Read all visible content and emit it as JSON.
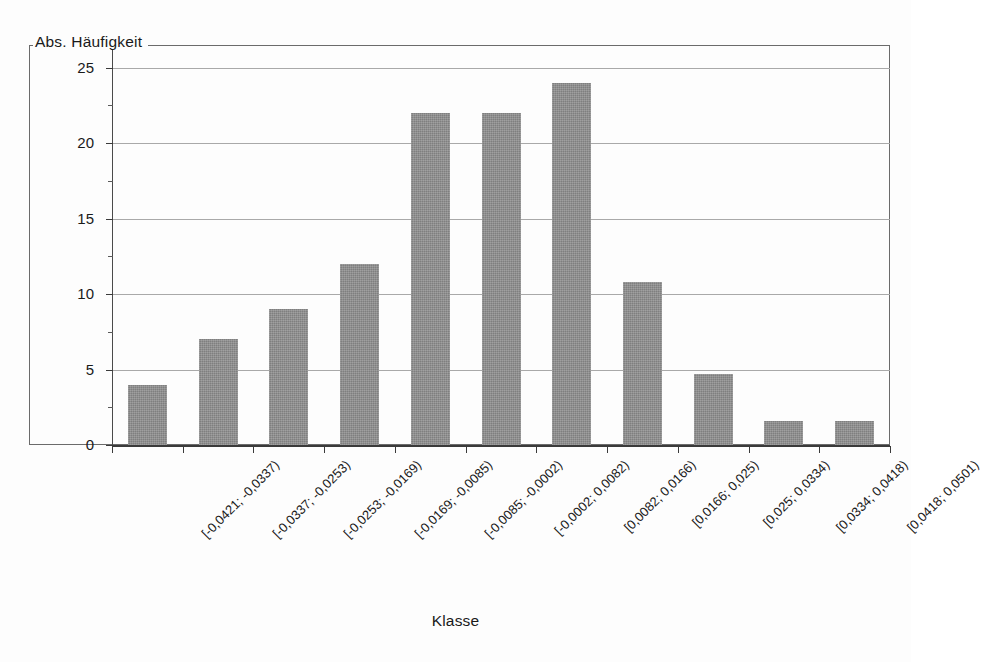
{
  "chart_data": {
    "type": "bar",
    "title": "",
    "subtitle": "",
    "xlabel": "Klasse",
    "ylabel": "Abs. Häufigkeit",
    "categories": [
      "[-0,0421; -0,0337)",
      "[-0,0337; -0,0253)",
      "[-0,0253; -0,0169)",
      "[-0,0169; -0,0085)",
      "[-0,0085; -0,0002)",
      "[-0,0002; 0,0082)",
      "[0,0082; 0,0166)",
      "[0,0166; 0,025)",
      "[0,025; 0,0334)",
      "[0,0334; 0,0418)",
      "[0,0418; 0,0501)"
    ],
    "values": [
      4,
      7,
      9,
      12,
      22,
      22,
      24,
      10.8,
      4.7,
      1.6,
      1.6
    ],
    "ylim": [
      0,
      26.5
    ],
    "yticks": [
      0,
      5,
      10,
      15,
      20,
      25
    ],
    "ytick_labels": [
      "0",
      "5",
      "10",
      "15",
      "20",
      "25"
    ],
    "grid": true,
    "grid_axis": "y",
    "legend": false,
    "legend_position": "none",
    "bar_color": "#8c8c8c",
    "axis_color": "#3a3a3a",
    "gridline_color": "#a9a9a9",
    "background_color": "#fdfdfd",
    "label_rotation": -45
  }
}
